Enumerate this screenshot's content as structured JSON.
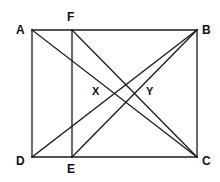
{
  "figure": {
    "kind": "geometry-diagram",
    "stroke_color": "#1a1a1a",
    "background_color": "#ffffff",
    "stroke_width": 1.3
  },
  "vertices": {
    "A": {
      "label": "A",
      "x": 32,
      "y": 30,
      "label_x": 16,
      "label_y": 24
    },
    "B": {
      "label": "B",
      "x": 197,
      "y": 30,
      "label_x": 202,
      "label_y": 24
    },
    "C": {
      "label": "C",
      "x": 197,
      "y": 157,
      "label_x": 202,
      "label_y": 155
    },
    "D": {
      "label": "D",
      "x": 32,
      "y": 157,
      "label_x": 16,
      "label_y": 155
    },
    "E": {
      "label": "E",
      "x": 72,
      "y": 157,
      "label_x": 67,
      "label_y": 163
    },
    "F": {
      "label": "F",
      "x": 72,
      "y": 30,
      "label_x": 67,
      "label_y": 11
    }
  },
  "interior_points": {
    "X": {
      "label": "X",
      "label_x": 92,
      "label_y": 86
    },
    "Y": {
      "label": "Y",
      "label_x": 146,
      "label_y": 86
    }
  },
  "edges": [
    {
      "name": "side-AB",
      "from": "A",
      "to": "B"
    },
    {
      "name": "side-BC",
      "from": "B",
      "to": "C"
    },
    {
      "name": "side-CD",
      "from": "C",
      "to": "D"
    },
    {
      "name": "side-DA",
      "from": "D",
      "to": "A"
    },
    {
      "name": "segment-FE",
      "from": "F",
      "to": "E"
    },
    {
      "name": "diagonal-AC",
      "from": "A",
      "to": "C"
    },
    {
      "name": "diagonal-DB",
      "from": "D",
      "to": "B"
    },
    {
      "name": "cevian-FC",
      "from": "F",
      "to": "C"
    },
    {
      "name": "cevian-EB",
      "from": "E",
      "to": "B"
    }
  ],
  "chart_data": {
    "type": "scatter",
    "xlabel": "",
    "ylabel": "",
    "xlim": [
      32,
      197
    ],
    "ylim": [
      30,
      157
    ],
    "grid": false,
    "legend": "none",
    "points": [
      {
        "name": "A",
        "x": 32,
        "y": 30
      },
      {
        "name": "B",
        "x": 197,
        "y": 30
      },
      {
        "name": "C",
        "x": 197,
        "y": 157
      },
      {
        "name": "D",
        "x": 32,
        "y": 157
      },
      {
        "name": "E",
        "x": 72,
        "y": 157
      },
      {
        "name": "F",
        "x": 72,
        "y": 30
      },
      {
        "name": "X",
        "x": 108,
        "y": 93
      },
      {
        "name": "Y",
        "x": 137,
        "y": 93
      }
    ],
    "segments": [
      {
        "name": "AB",
        "from": [
          32,
          30
        ],
        "to": [
          197,
          30
        ]
      },
      {
        "name": "BC",
        "from": [
          197,
          30
        ],
        "to": [
          197,
          157
        ]
      },
      {
        "name": "CD",
        "from": [
          197,
          157
        ],
        "to": [
          32,
          157
        ]
      },
      {
        "name": "DA",
        "from": [
          32,
          157
        ],
        "to": [
          32,
          30
        ]
      },
      {
        "name": "FE",
        "from": [
          72,
          30
        ],
        "to": [
          72,
          157
        ]
      },
      {
        "name": "AC",
        "from": [
          32,
          30
        ],
        "to": [
          197,
          157
        ]
      },
      {
        "name": "DB",
        "from": [
          32,
          157
        ],
        "to": [
          197,
          30
        ]
      },
      {
        "name": "FC",
        "from": [
          72,
          30
        ],
        "to": [
          197,
          157
        ]
      },
      {
        "name": "EB",
        "from": [
          72,
          157
        ],
        "to": [
          197,
          30
        ]
      }
    ]
  }
}
